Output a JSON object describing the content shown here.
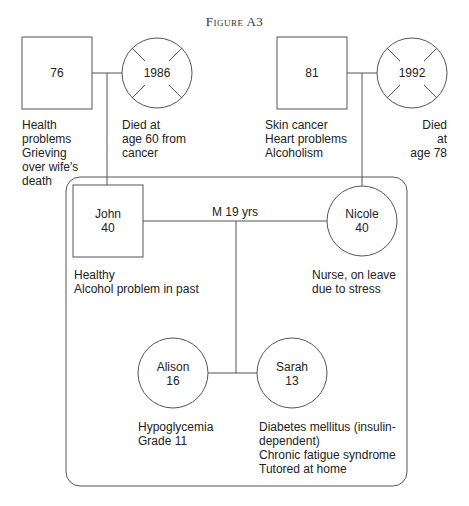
{
  "figure": {
    "title": "Figure A3"
  },
  "grandparents_paternal": {
    "father": {
      "label": "76",
      "notes": "Health\nproblems\nGrieving\nover wife's\ndeath"
    },
    "mother": {
      "label": "1986",
      "deceased": true,
      "notes": "Died at\nage 60 from\ncancer"
    }
  },
  "grandparents_maternal": {
    "father": {
      "label": "81",
      "notes": "Skin cancer\nHeart problems\nAlcoholism"
    },
    "mother": {
      "label": "1992",
      "deceased": true,
      "notes": "Died at\nage 78"
    }
  },
  "household": {
    "marriage_label": "M 19 yrs",
    "john": {
      "name": "John",
      "age": "40",
      "notes": "Healthy\nAlcohol problem in past"
    },
    "nicole": {
      "name": "Nicole",
      "age": "40",
      "notes": "Nurse, on leave\ndue to stress"
    },
    "alison": {
      "name": "Alison",
      "age": "16",
      "notes": "Hypoglycemia\nGrade 11"
    },
    "sarah": {
      "name": "Sarah",
      "age": "13",
      "notes": "Diabetes mellitus (insulin-\ndependent)\nChronic fatigue syndrome\nTutored at home"
    }
  },
  "colors": {
    "line": "#555555",
    "text": "#222222",
    "background": "#ffffff"
  }
}
